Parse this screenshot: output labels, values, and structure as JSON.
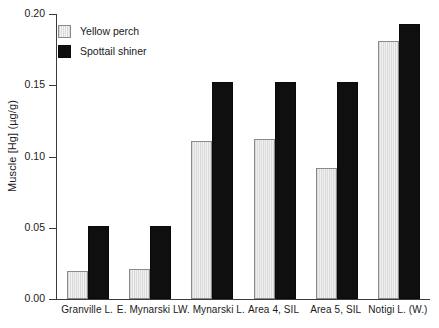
{
  "chart_data": {
    "type": "bar",
    "title": "",
    "xlabel": "",
    "ylabel": "Muscle [Hg] (µg/g)",
    "ylim": [
      0.0,
      0.2
    ],
    "yticks": [
      "0.00",
      "0.05",
      "0.10",
      "0.15",
      "0.20"
    ],
    "ytick_values": [
      0.0,
      0.05,
      0.1,
      0.15,
      0.2
    ],
    "grid": false,
    "legend_position": "upper-left-inside",
    "categories": [
      "Granville L.",
      "E. Mynarski L.",
      "W. Mynarski L.",
      "Area 4, SIL",
      "Area 5, SIL",
      "Notigi L. (W.)"
    ],
    "series": [
      {
        "name": "Yellow perch",
        "color": "#e2e2e2",
        "values": [
          0.02,
          0.021,
          0.111,
          0.112,
          0.092,
          0.181
        ]
      },
      {
        "name": "Spottail shiner",
        "color": "#100f0f",
        "values": [
          0.051,
          0.051,
          0.152,
          0.152,
          0.152,
          0.193
        ]
      }
    ]
  },
  "legend": {
    "items": [
      {
        "label": "Yellow perch",
        "swatch": "hatched-light-gray"
      },
      {
        "label": "Spottail shiner",
        "swatch": "solid-black"
      }
    ]
  }
}
